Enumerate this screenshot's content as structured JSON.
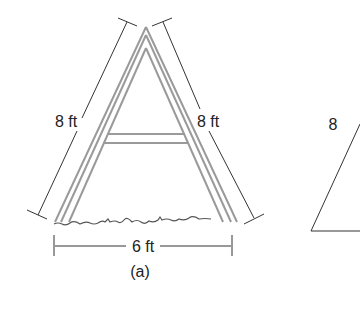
{
  "figure": {
    "panel_a": {
      "left_leg_label": "8 ft",
      "right_leg_label": "8 ft",
      "base_label": "6 ft",
      "caption": "(a)"
    },
    "panel_b": {
      "side_label": "8"
    }
  },
  "colors": {
    "frame_stroke": "#9a9a9a",
    "dimension_stroke": "#333333",
    "text": "#222222",
    "ground": "#555555"
  }
}
